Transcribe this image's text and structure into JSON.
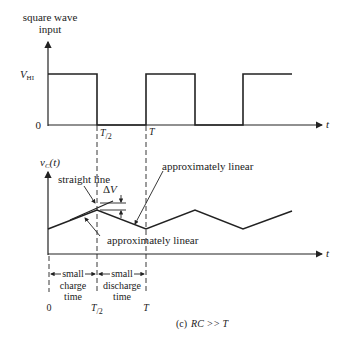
{
  "top_plot": {
    "ylabel_line1": "square wave",
    "ylabel_line2": "input",
    "v_hi_main": "V",
    "v_hi_sub": "HI",
    "zero_label": "0",
    "t_half_main": "T",
    "t_half_sub": "/2",
    "t_label": "T",
    "x_axis_label": "t"
  },
  "bottom_plot": {
    "ylabel_main": "v",
    "ylabel_sub": "C",
    "ylabel_suffix": "(t)",
    "annotation_straight_line": "straight line",
    "annotation_delta_v": "ΔV",
    "annotation_approx_linear_top": "approximately linear",
    "annotation_approx_linear_bottom": "approximately linear",
    "x_axis_label": "t"
  },
  "time_labels": {
    "charge_line1": "small",
    "charge_line2": "charge",
    "charge_line3": "time",
    "discharge_line1": "small",
    "discharge_line2": "discharge",
    "discharge_line3": "time",
    "zero": "0",
    "t_half_main": "T",
    "t_half_sub": "/2",
    "t": "T"
  },
  "caption": {
    "prefix": "(c)",
    "condition": "RC >> T"
  },
  "colors": {
    "line": "#222222",
    "background": "#ffffff"
  }
}
